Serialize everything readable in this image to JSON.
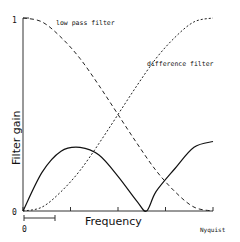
{
  "chart_data": {
    "type": "line",
    "title": "",
    "xlabel": "Frequency",
    "ylabel": "Filter gain",
    "xlim": [
      0,
      1
    ],
    "ylim": [
      0,
      1
    ],
    "x_tick_labels": [
      "0",
      "Nyquist"
    ],
    "y_tick_labels": [
      "0",
      "1"
    ],
    "x_ticks": [
      0,
      0.25,
      0.5,
      0.75,
      1.0
    ],
    "grid": false,
    "legend": "inline annotations",
    "scale_bar": {
      "label": "0",
      "from": 0,
      "to": 0.25
    },
    "series": [
      {
        "name": "low pass filter",
        "style": "dashed",
        "x": [
          0,
          0.1,
          0.2,
          0.3,
          0.4,
          0.5,
          0.6,
          0.7,
          0.8,
          0.9,
          1.0
        ],
        "values": [
          1.0,
          0.98,
          0.9,
          0.79,
          0.65,
          0.5,
          0.35,
          0.21,
          0.1,
          0.02,
          0.0
        ]
      },
      {
        "name": "difference filter",
        "style": "dashed",
        "x": [
          0,
          0.1,
          0.2,
          0.3,
          0.4,
          0.5,
          0.6,
          0.7,
          0.8,
          0.9,
          1.0
        ],
        "values": [
          0.0,
          0.02,
          0.1,
          0.21,
          0.35,
          0.5,
          0.65,
          0.79,
          0.9,
          0.98,
          1.0
        ]
      },
      {
        "name": "combined response",
        "style": "solid",
        "x": [
          0,
          0.1,
          0.2,
          0.3,
          0.4,
          0.5,
          0.6,
          0.65,
          0.7,
          0.8,
          0.9,
          1.0
        ],
        "values": [
          0.0,
          0.2,
          0.31,
          0.33,
          0.29,
          0.18,
          0.05,
          0.0,
          0.1,
          0.22,
          0.33,
          0.36
        ]
      }
    ],
    "annotations": [
      {
        "text": "low pass filter",
        "x": 0.3,
        "y": 0.98
      },
      {
        "text": "difference filter",
        "x": 0.67,
        "y": 0.7
      }
    ]
  },
  "labels": {
    "y_axis_title": "Filter gain",
    "x_axis_title": "Frequency",
    "y_top": "1",
    "y_bottom": "0",
    "x_left": "0",
    "x_right": "Nyquist",
    "low_pass": "low pass filter",
    "difference": "difference filter"
  }
}
